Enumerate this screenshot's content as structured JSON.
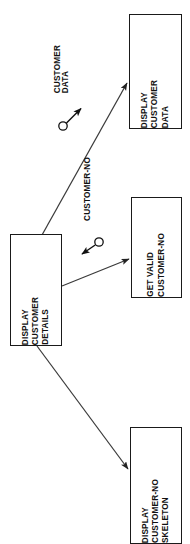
{
  "diagram": {
    "type": "structure-chart",
    "title_visible": false,
    "background_color": "#ffffff",
    "line_color": "#333333",
    "text_color": "#111111",
    "text_orientation": "rotated-90-ccw",
    "nodes": [
      {
        "id": "display-customer-details",
        "lines": [
          "DISPLAY",
          "CUSTOMER",
          "DETAILS"
        ],
        "x": 10,
        "y": 234,
        "w": 52,
        "h": 112
      },
      {
        "id": "display-customer-data",
        "lines": [
          "DISPLAY",
          "CUSTOMER",
          "DATA"
        ],
        "x": 129,
        "y": 14,
        "w": 53,
        "h": 115
      },
      {
        "id": "get-valid-customer-no",
        "lines": [
          "GET VALID",
          "CUSTOMER-NO"
        ],
        "x": 131,
        "y": 197,
        "w": 51,
        "h": 101
      },
      {
        "id": "display-customer-no-skeleton",
        "lines": [
          "DISPLAY",
          "CUSTOMER-NO",
          "SKELETON"
        ],
        "x": 130,
        "y": 427,
        "w": 52,
        "h": 117
      }
    ],
    "edges": [
      {
        "id": "edge-to-display-customer-data",
        "from": "display-customer-details",
        "to": "display-customer-data",
        "x1": 42,
        "y1": 235,
        "x2": 128,
        "y2": 82,
        "arrow": true
      },
      {
        "id": "edge-to-get-valid-customer-no",
        "from": "display-customer-details",
        "to": "get-valid-customer-no",
        "x1": 62,
        "y1": 286,
        "x2": 130,
        "y2": 258,
        "arrow": true
      },
      {
        "id": "edge-to-display-customer-no-skeleton",
        "from": "display-customer-details",
        "to": "display-customer-no-skeleton",
        "x1": 37,
        "y1": 346,
        "x2": 129,
        "y2": 470,
        "arrow": true
      }
    ],
    "data_couples": [
      {
        "id": "couple-customer-data",
        "label": "CUSTOMER DATA",
        "label_lines": [
          "CUSTOMER",
          "DATA"
        ],
        "direction": "up-right",
        "circle_cx": 63,
        "circle_cy": 126,
        "circle_r": 4.2,
        "arrow_x1": 67,
        "arrow_y1": 122,
        "arrow_x2": 82,
        "arrow_y2": 107,
        "label_x": 54,
        "label_y": 45
      },
      {
        "id": "couple-customer-no",
        "label": "CUSTOMER-NO",
        "label_lines": [
          "CUSTOMER-NO"
        ],
        "direction": "down-left",
        "circle_cx": 99,
        "circle_cy": 242,
        "circle_r": 4.2,
        "arrow_x1": 95,
        "arrow_y1": 246,
        "arrow_x2": 80,
        "arrow_y2": 256,
        "label_x": 84,
        "label_y": 157
      }
    ]
  }
}
